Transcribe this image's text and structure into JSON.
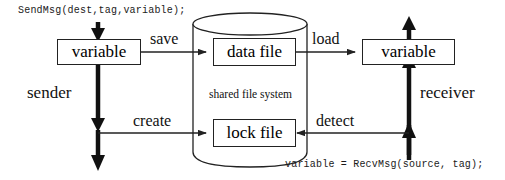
{
  "diagram": {
    "colors": {
      "stroke": "#222222",
      "thick_stroke": "#111111",
      "background": "#ffffff",
      "text": "#111111"
    },
    "code": {
      "send_call": "SendMsg(dest,tag,variable);",
      "recv_call": "variable = RecvMsg(source, tag);"
    },
    "actors": {
      "sender": "sender",
      "receiver": "receiver"
    },
    "boxes": {
      "sender_variable": "variable",
      "receiver_variable": "variable",
      "data_file": "data file",
      "lock_file": "lock file"
    },
    "storage": {
      "caption": "shared file system"
    },
    "arrows": [
      {
        "id": "save",
        "label": "save",
        "from": "sender_variable",
        "to": "data_file",
        "direction": "right"
      },
      {
        "id": "load",
        "label": "load",
        "from": "data_file",
        "to": "receiver_variable",
        "direction": "right"
      },
      {
        "id": "create",
        "label": "create",
        "from": "sender",
        "to": "lock_file",
        "direction": "right"
      },
      {
        "id": "detect",
        "label": "detect",
        "from": "receiver",
        "to": "lock_file",
        "direction": "left"
      }
    ]
  }
}
